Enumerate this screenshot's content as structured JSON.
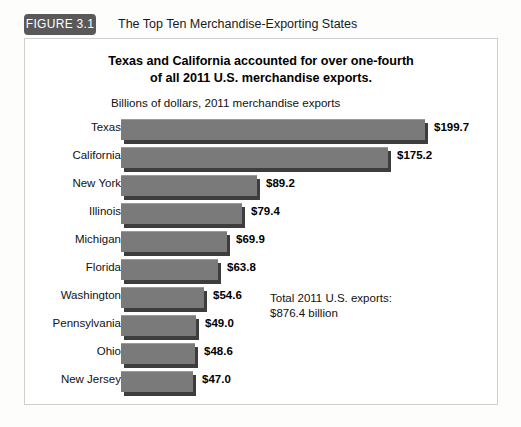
{
  "figure": {
    "tag": "FIGURE 3.1",
    "caption": "The Top Ten Merchandise-Exporting States"
  },
  "chart": {
    "title_line1": "Texas and California accounted for over one-fourth",
    "title_line2": "of all 2011 U.S. merchandise exports.",
    "subtitle": "Billions of dollars, 2011 merchandise exports",
    "note_line1": "Total 2011 U.S. exports:",
    "note_line2": "$876.4 billion"
  },
  "chart_data": {
    "type": "bar",
    "orientation": "horizontal",
    "title": "Texas and California accounted for over one-fourth of all 2011 U.S. merchandise exports.",
    "subtitle": "Billions of dollars, 2011 merchandise exports",
    "xlabel": "Billions of dollars",
    "ylabel": "",
    "xlim": [
      0,
      200
    ],
    "grid": false,
    "legend": "none",
    "bar_color": "#7a7a7a",
    "bar_shadow_color": "#3d3d3d",
    "categories": [
      "Texas",
      "California",
      "New York",
      "Illinois",
      "Michigan",
      "Florida",
      "Washington",
      "Pennsylvania",
      "Ohio",
      "New Jersey"
    ],
    "values": [
      199.7,
      175.2,
      89.2,
      79.4,
      69.9,
      63.8,
      54.6,
      49.0,
      48.6,
      47.0
    ],
    "value_labels": [
      "$199.7",
      "$175.2",
      "$89.2",
      "$79.4",
      "$69.9",
      "$63.8",
      "$54.6",
      "$49.0",
      "$48.6",
      "$47.0"
    ],
    "annotation": "Total 2011 U.S. exports: $876.4 billion",
    "annotation_value": 876.4
  }
}
